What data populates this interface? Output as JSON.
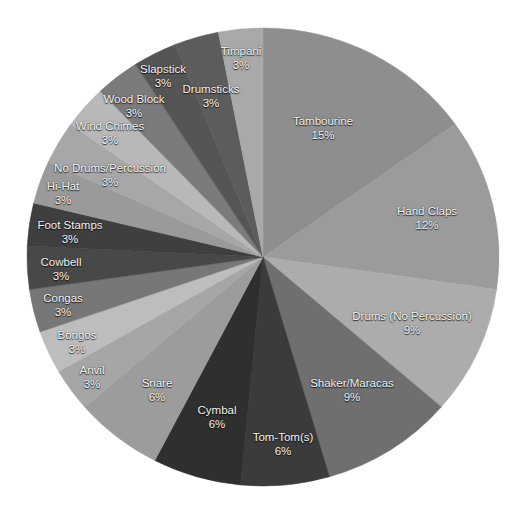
{
  "chart_data": {
    "type": "pie",
    "title": "",
    "start_angle": "12 o'clock, clockwise",
    "legend": "none (labels on slices)",
    "slices": [
      {
        "label": "Tambourine",
        "value": 15,
        "display": "15%",
        "color": "#8e8e8e",
        "lx": 323,
        "ly": 128
      },
      {
        "label": "Hand Claps",
        "value": 12,
        "display": "12%",
        "color": "#9b9b9b",
        "lx": 427,
        "ly": 218
      },
      {
        "label": "Drums (No Percussion)",
        "value": 9,
        "display": "9%",
        "color": "#acacac",
        "lx": 412,
        "ly": 323
      },
      {
        "label": "Shaker/Maracas",
        "value": 9,
        "display": "9%",
        "color": "#6f6f6f",
        "lx": 352,
        "ly": 390
      },
      {
        "label": "Tom-Tom(s)",
        "value": 6,
        "display": "6%",
        "color": "#3b3b3b",
        "lx": 283,
        "ly": 444
      },
      {
        "label": "Cymbal",
        "value": 6,
        "display": "6%",
        "color": "#2f2f2f",
        "lx": 217,
        "ly": 417
      },
      {
        "label": "Snare",
        "value": 6,
        "display": "6%",
        "color": "#9c9c9c",
        "lx": 157,
        "ly": 390
      },
      {
        "label": "Anvil",
        "value": 3,
        "display": "3%",
        "color": "#a6a6a6",
        "lx": 92,
        "ly": 377
      },
      {
        "label": "Bongos",
        "value": 3,
        "display": "3%",
        "color": "#bdbdbd",
        "lx": 77,
        "ly": 342
      },
      {
        "label": "Congas",
        "value": 3,
        "display": "3%",
        "color": "#777777",
        "lx": 63,
        "ly": 305
      },
      {
        "label": "Cowbell",
        "value": 3,
        "display": "3%",
        "color": "#484848",
        "lx": 61,
        "ly": 269
      },
      {
        "label": "Foot Stamps",
        "value": 3,
        "display": "3%",
        "color": "#3f3f3f",
        "lx": 70,
        "ly": 232
      },
      {
        "label": "Hi-Hat",
        "value": 3,
        "display": "3%",
        "color": "#9a9a9a",
        "lx": 63,
        "ly": 193
      },
      {
        "label": "No Drums/Percussion",
        "value": 3,
        "display": "3%",
        "color": "#a7a7a7",
        "lx": 110,
        "ly": 175
      },
      {
        "label": "Wind Chimes",
        "value": 3,
        "display": "3%",
        "color": "#b8b8b8",
        "lx": 110,
        "ly": 133
      },
      {
        "label": "Wood Block",
        "value": 3,
        "display": "3%",
        "color": "#7b7b7b",
        "lx": 134,
        "ly": 106
      },
      {
        "label": "Slapstick",
        "value": 3,
        "display": "3%",
        "color": "#555555",
        "lx": 163,
        "ly": 76
      },
      {
        "label": "Drumsticks",
        "value": 3,
        "display": "3%",
        "color": "#5c5c5c",
        "lx": 211,
        "ly": 96
      },
      {
        "label": "Timpani",
        "value": 3,
        "display": "3%",
        "color": "#a9a9a9",
        "lx": 241,
        "ly": 58
      }
    ]
  },
  "layout": {
    "cx": 263,
    "cy": 257,
    "rx": 236,
    "ry": 229
  }
}
